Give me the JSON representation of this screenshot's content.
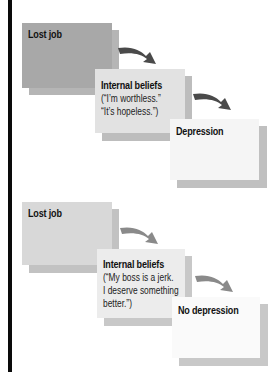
{
  "diagram": {
    "scenarios": [
      {
        "name": "depression-path",
        "nodes": [
          {
            "title": "Lost job",
            "lines": []
          },
          {
            "title": "Internal beliefs",
            "lines": [
              "(“I’m worthless.”",
              "“It’s hopeless.”)"
            ]
          },
          {
            "title": "Depression",
            "lines": []
          }
        ],
        "colors": {
          "box1": "#a8a8a8",
          "box2": "#e2e2e2",
          "box3": "#f5f5f5",
          "shadow": "#b8b8b8",
          "arrow": "#4a4a4a"
        }
      },
      {
        "name": "no-depression-path",
        "nodes": [
          {
            "title": "Lost job",
            "lines": []
          },
          {
            "title": "Internal beliefs",
            "lines": [
              "(“My boss is a jerk.",
              "I deserve something",
              "better.”)"
            ]
          },
          {
            "title": "No depression",
            "lines": []
          }
        ],
        "colors": {
          "box1": "#d8d8d8",
          "box2": "#ececec",
          "box3": "#fafafa",
          "shadow": "#c4c4c4",
          "arrow": "#8a8a8a"
        }
      }
    ]
  }
}
